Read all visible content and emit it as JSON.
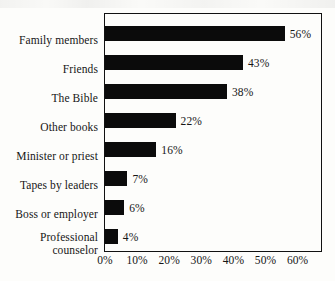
{
  "chart_data": {
    "type": "bar",
    "orientation": "horizontal",
    "title": "",
    "xlabel": "",
    "ylabel": "",
    "categories": [
      "Family members",
      "Friends",
      "The Bible",
      "Other books",
      "Minister or priest",
      "Tapes by leaders",
      "Boss or employer",
      "Professional counselor"
    ],
    "values": [
      56,
      43,
      38,
      22,
      16,
      7,
      6,
      4
    ],
    "value_labels": [
      "56%",
      "43%",
      "38%",
      "22%",
      "16%",
      "7%",
      "6%",
      "4%"
    ],
    "xticks": [
      0,
      10,
      20,
      30,
      40,
      50,
      60
    ],
    "xtick_labels": [
      "0%",
      "10%",
      "20%",
      "30%",
      "40%",
      "50%",
      "60%"
    ],
    "xlim": [
      0,
      60
    ],
    "grid": false,
    "legend": null,
    "bar_color": "#0b0b0b",
    "frame_color": "#111111",
    "background_color": "#fdfdfb"
  },
  "labels": {
    "professional_counselor_line1": "Professional",
    "professional_counselor_line2": "counselor"
  }
}
